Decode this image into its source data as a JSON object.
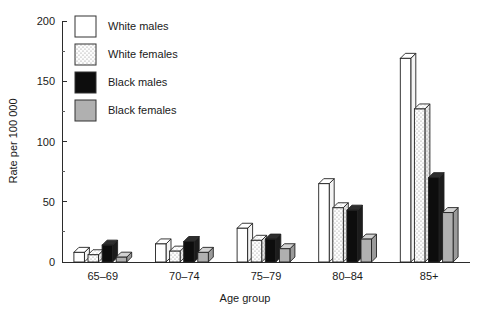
{
  "chart_data": {
    "type": "bar",
    "title": "",
    "xlabel": "Age group",
    "ylabel": "Rate per 100 000",
    "categories": [
      "65–69",
      "70–74",
      "75–79",
      "80–84",
      "85+"
    ],
    "ylim": [
      0,
      200
    ],
    "yticks": [
      0,
      50,
      100,
      150,
      200
    ],
    "ytick_labels": [
      "0",
      "50",
      "100",
      "150",
      "200"
    ],
    "yticks_minor": [
      25,
      75,
      125,
      175
    ],
    "grid": false,
    "legend_position": "top-left-inside",
    "series": [
      {
        "name": "White males",
        "fill": "#ffffff",
        "pattern": "solid-white",
        "values": [
          8,
          15,
          28,
          65,
          169
        ]
      },
      {
        "name": "White females",
        "fill": "#f2f2f2",
        "pattern": "dotted",
        "values": [
          6,
          9,
          18,
          45,
          127
        ]
      },
      {
        "name": "Black males",
        "fill": "#0d0d0d",
        "pattern": "solid-black",
        "values": [
          14,
          17,
          19,
          43,
          70
        ]
      },
      {
        "name": "Black females",
        "fill": "#b0b0b0",
        "pattern": "solid-gray",
        "values": [
          4,
          8,
          11,
          19,
          41
        ]
      }
    ]
  },
  "legend": {
    "items": [
      {
        "label": "White males"
      },
      {
        "label": "White females"
      },
      {
        "label": "Black males"
      },
      {
        "label": "Black females"
      }
    ]
  },
  "axes": {
    "y_title": "Rate per 100 000",
    "x_title": "Age group"
  },
  "colors": {
    "axis": "#2b2b2b",
    "outline": "#222222",
    "white_males": "#ffffff",
    "white_females": "#f2f2f2",
    "black_males": "#0d0d0d",
    "black_females": "#b0b0b0",
    "background": "#ffffff"
  }
}
